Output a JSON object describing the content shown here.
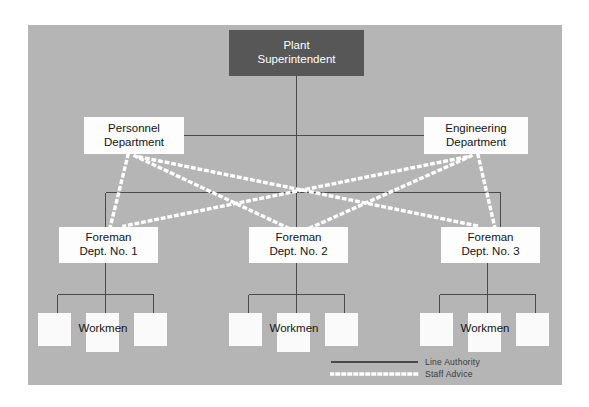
{
  "diagram": {
    "panel": {
      "background_color": "#b5b5b5"
    },
    "colors": {
      "panel_gray": "#b5b5b5",
      "box_white": "#fdfdfd",
      "box_dark": "#575757",
      "line_authority": "#4a4a4a",
      "staff_advice": "#ffffff",
      "text_dark": "#141414",
      "text_light": "#ffffff"
    }
  },
  "nodes": {
    "superintendent": {
      "line1": "Plant",
      "line2": "Superintendent"
    },
    "personnel": {
      "line1": "Personnel",
      "line2": "Department"
    },
    "engineering": {
      "line1": "Engineering",
      "line2": "Department"
    },
    "foremen": [
      {
        "line1": "Foreman",
        "line2": "Dept. No. 1"
      },
      {
        "line1": "Foreman",
        "line2": "Dept. No. 2"
      },
      {
        "line1": "Foreman",
        "line2": "Dept. No. 3"
      }
    ],
    "workmen_groups": [
      {
        "label": "Workmen",
        "box_count": 3
      },
      {
        "label": "Workmen",
        "box_count": 3
      },
      {
        "label": "Workmen",
        "box_count": 3
      }
    ]
  },
  "legend": {
    "items": [
      {
        "label": "Line Authority",
        "style": "solid",
        "color": "#4a4a4a"
      },
      {
        "label": "Staff Advice",
        "style": "dotted",
        "color": "#ffffff"
      }
    ]
  }
}
